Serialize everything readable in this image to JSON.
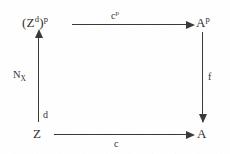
{
  "diagram": {
    "kind": "commutative-diagram",
    "background_color": "#fefefe",
    "ink_color": "#3a3a3a",
    "nodes": {
      "top_left": {
        "base": "(Z",
        "sup_inner": "d",
        "mid": ")",
        "sup_outer": "p",
        "full": "(Z^d)^p"
      },
      "top_right": {
        "base": "A",
        "sup": "p",
        "full": "A^p"
      },
      "bottom_left": {
        "base": "Z",
        "full": "Z"
      },
      "bottom_right": {
        "base": "A",
        "full": "A"
      }
    },
    "arrows": {
      "top": {
        "label_base": "c",
        "label_sup": "p",
        "label_full": "c^p",
        "direction": "right"
      },
      "bottom": {
        "label_base": "c",
        "label_full": "c",
        "direction": "right"
      },
      "left": {
        "label_base": "N",
        "label_sub": "X",
        "label_full": "N_X",
        "secondary_label": "d",
        "direction": "up"
      },
      "right": {
        "label_base": "f",
        "label_full": "f",
        "direction": "down"
      }
    }
  }
}
